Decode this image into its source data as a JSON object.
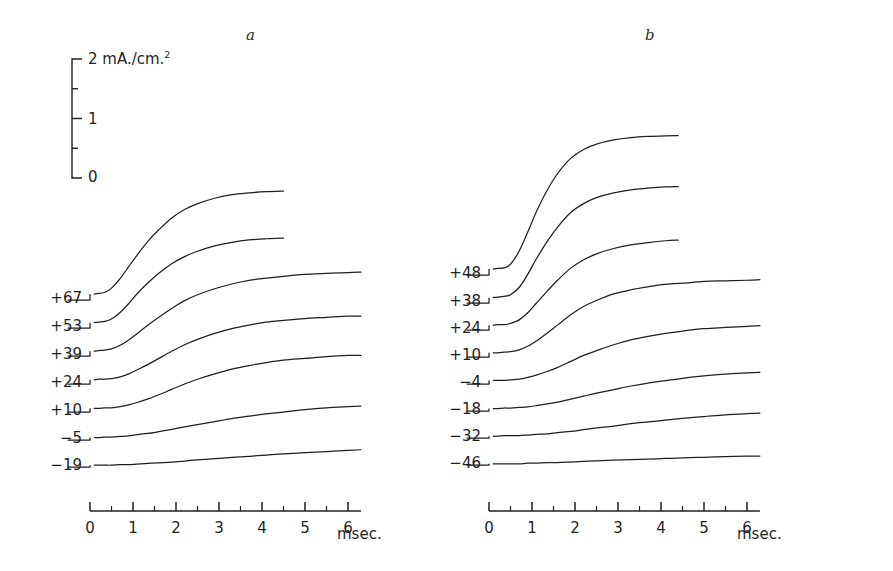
{
  "figure": {
    "background_color": "#ffffff",
    "ink_color": "#1f1f1f",
    "panels": [
      {
        "id": "a",
        "letter": "a"
      },
      {
        "id": "b",
        "letter": "b"
      }
    ]
  },
  "scalebar": {
    "unit_label": "mA./cm.",
    "unit_exponent": "2",
    "top_value": "2",
    "mid_value": "1",
    "bottom_value": "0",
    "ticks": [
      0,
      0.5,
      1,
      1.5,
      2
    ]
  },
  "axis": {
    "tick_labels": [
      "0",
      "1",
      "2",
      "3",
      "4",
      "5",
      "6"
    ],
    "unit": "msec.",
    "min": 0,
    "max": 6.3,
    "minor_tick_step": 0.5,
    "major_tick_step": 1
  },
  "chart_data": {
    "type": "line",
    "title": "",
    "subtitle": "",
    "xlabel": "msec.",
    "ylabel": "mA./cm.2",
    "xlim": [
      0,
      6.3
    ],
    "ylim": [
      0,
      2
    ],
    "grid": false,
    "legend": "none",
    "annotations": [
      "a",
      "b"
    ],
    "y_tick_labels": [
      "0",
      "1",
      "2"
    ],
    "x_tick_labels": [
      "0",
      "1",
      "2",
      "3",
      "4",
      "5",
      "6"
    ],
    "note": "Each trace is offset vertically; its label is the membrane depolarization in mV. Values below are current density in mA./cm.2 above each trace's own baseline.",
    "panels": [
      {
        "id": "a",
        "label": "a",
        "x": [
          0,
          0.1,
          0.2,
          0.35,
          0.5,
          0.7,
          0.9,
          1.1,
          1.35,
          1.6,
          1.9,
          2.2,
          2.5,
          2.9,
          3.3,
          3.7,
          4.1,
          4.5,
          5.0,
          5.5,
          6.0,
          6.3
        ],
        "series": [
          {
            "name": "+67",
            "label": "+67",
            "units": "mV",
            "x_end": 4.5,
            "values": [
              0.0,
              0.1,
              0.11,
              0.13,
              0.2,
              0.36,
              0.56,
              0.76,
              0.99,
              1.18,
              1.38,
              1.52,
              1.62,
              1.71,
              1.77,
              1.8,
              1.82,
              1.83,
              null,
              null,
              null,
              null
            ]
          },
          {
            "name": "+53",
            "label": "+53",
            "units": "mV",
            "x_end": 4.5,
            "values": [
              0.0,
              0.09,
              0.1,
              0.11,
              0.15,
              0.26,
              0.41,
              0.58,
              0.76,
              0.92,
              1.08,
              1.2,
              1.29,
              1.38,
              1.44,
              1.48,
              1.5,
              1.51,
              null,
              null,
              null,
              null
            ]
          },
          {
            "name": "+39",
            "label": "+39",
            "units": "mV",
            "x_end": 6.3,
            "values": [
              0.0,
              0.08,
              0.09,
              0.1,
              0.12,
              0.18,
              0.27,
              0.38,
              0.52,
              0.65,
              0.8,
              0.93,
              1.03,
              1.13,
              1.21,
              1.27,
              1.31,
              1.34,
              1.37,
              1.39,
              1.4,
              1.41
            ]
          },
          {
            "name": "+24",
            "label": "+24",
            "units": "mV",
            "x_end": 6.3,
            "values": [
              0.0,
              0.07,
              0.08,
              0.08,
              0.09,
              0.12,
              0.17,
              0.24,
              0.33,
              0.43,
              0.55,
              0.66,
              0.75,
              0.85,
              0.93,
              0.99,
              1.04,
              1.07,
              1.1,
              1.12,
              1.14,
              1.14
            ]
          },
          {
            "name": "+10",
            "label": "+10",
            "units": "mV",
            "x_end": 6.3,
            "values": [
              0.0,
              0.06,
              0.06,
              0.07,
              0.07,
              0.09,
              0.12,
              0.16,
              0.22,
              0.29,
              0.38,
              0.47,
              0.55,
              0.64,
              0.72,
              0.78,
              0.83,
              0.87,
              0.9,
              0.93,
              0.95,
              0.95
            ]
          },
          {
            "name": "-5",
            "label": "−5",
            "units": "mV",
            "x_end": 6.3,
            "values": [
              0.0,
              0.04,
              0.04,
              0.05,
              0.05,
              0.06,
              0.07,
              0.09,
              0.11,
              0.14,
              0.18,
              0.22,
              0.26,
              0.31,
              0.36,
              0.4,
              0.44,
              0.47,
              0.51,
              0.54,
              0.56,
              0.57
            ]
          },
          {
            "name": "-19",
            "label": "−19",
            "units": "mV",
            "x_end": 6.3,
            "values": [
              0.0,
              0.03,
              0.03,
              0.03,
              0.03,
              0.04,
              0.04,
              0.05,
              0.06,
              0.07,
              0.08,
              0.1,
              0.12,
              0.14,
              0.16,
              0.18,
              0.2,
              0.22,
              0.24,
              0.26,
              0.28,
              0.29
            ]
          }
        ]
      },
      {
        "id": "b",
        "label": "b",
        "x": [
          0,
          0.1,
          0.2,
          0.35,
          0.5,
          0.7,
          0.9,
          1.1,
          1.35,
          1.6,
          1.9,
          2.2,
          2.5,
          2.9,
          3.3,
          3.7,
          4.1,
          4.5,
          5.0,
          5.5,
          6.0,
          6.3
        ],
        "series": [
          {
            "name": "+48",
            "label": "+48",
            "units": "mV",
            "x_end": 4.4,
            "values": [
              0.0,
              0.1,
              0.11,
              0.12,
              0.18,
              0.4,
              0.72,
              1.06,
              1.42,
              1.71,
              1.96,
              2.11,
              2.2,
              2.27,
              2.31,
              2.33,
              2.34,
              2.35,
              null,
              null,
              null,
              null
            ]
          },
          {
            "name": "+38",
            "label": "+38",
            "units": "mV",
            "x_end": 4.4,
            "values": [
              0.0,
              0.09,
              0.1,
              0.11,
              0.14,
              0.26,
              0.48,
              0.74,
              1.03,
              1.28,
              1.52,
              1.67,
              1.77,
              1.85,
              1.9,
              1.93,
              1.95,
              1.96,
              null,
              null,
              null,
              null
            ]
          },
          {
            "name": "+24",
            "label": "+24",
            "units": "mV",
            "x_end": 4.4,
            "values": [
              0.0,
              0.08,
              0.09,
              0.09,
              0.11,
              0.17,
              0.29,
              0.45,
              0.65,
              0.84,
              1.04,
              1.18,
              1.28,
              1.37,
              1.43,
              1.47,
              1.5,
              1.52,
              null,
              null,
              null,
              null
            ]
          },
          {
            "name": "+10",
            "label": "+10",
            "units": "mV",
            "x_end": 6.3,
            "values": [
              0.0,
              0.07,
              0.07,
              0.08,
              0.09,
              0.12,
              0.18,
              0.27,
              0.4,
              0.54,
              0.71,
              0.85,
              0.95,
              1.06,
              1.13,
              1.18,
              1.22,
              1.24,
              1.27,
              1.28,
              1.29,
              1.3
            ]
          },
          {
            "name": "-4",
            "label": "−4",
            "units": "mV",
            "x_end": 6.3,
            "values": [
              0.0,
              0.06,
              0.06,
              0.06,
              0.07,
              0.08,
              0.11,
              0.15,
              0.21,
              0.28,
              0.38,
              0.48,
              0.56,
              0.66,
              0.74,
              0.8,
              0.85,
              0.89,
              0.93,
              0.95,
              0.97,
              0.98
            ]
          },
          {
            "name": "-18",
            "label": "−18",
            "units": "mV",
            "x_end": 6.3,
            "values": [
              0.0,
              0.04,
              0.04,
              0.05,
              0.05,
              0.06,
              0.07,
              0.09,
              0.12,
              0.15,
              0.2,
              0.25,
              0.3,
              0.36,
              0.42,
              0.47,
              0.51,
              0.55,
              0.59,
              0.62,
              0.64,
              0.65
            ]
          },
          {
            "name": "-32",
            "label": "−32",
            "units": "mV",
            "x_end": 6.3,
            "values": [
              0.0,
              0.03,
              0.03,
              0.04,
              0.04,
              0.04,
              0.05,
              0.06,
              0.07,
              0.09,
              0.11,
              0.14,
              0.17,
              0.2,
              0.24,
              0.27,
              0.3,
              0.33,
              0.36,
              0.39,
              0.41,
              0.42
            ]
          },
          {
            "name": "-46",
            "label": "−46",
            "units": "mV",
            "x_end": 6.3,
            "values": [
              0.0,
              0.02,
              0.02,
              0.02,
              0.02,
              0.02,
              0.03,
              0.03,
              0.04,
              0.04,
              0.05,
              0.06,
              0.07,
              0.08,
              0.09,
              0.1,
              0.11,
              0.12,
              0.13,
              0.14,
              0.15,
              0.15
            ]
          }
        ]
      }
    ]
  }
}
